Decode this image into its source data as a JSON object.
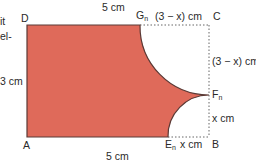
{
  "fragments": {
    "line1": "it",
    "line2": "el-"
  },
  "diagram": {
    "fill_color": "#df6a5a",
    "edge_color": "#5a3a36",
    "vertices": {
      "A": "A",
      "B": "B",
      "C": "C",
      "D": "D",
      "E": "E",
      "E_sub": "n",
      "F": "F",
      "F_sub": "n",
      "G": "G",
      "G_sub": "n"
    },
    "labels": {
      "top_length": "5 cm",
      "bottom_length": "5 cm",
      "left_height": "3 cm",
      "top_remainder": "(3 − x) cm",
      "right_upper": "(3 − x) cm",
      "right_lower": "x cm",
      "bottom_remainder": "x cm"
    }
  }
}
